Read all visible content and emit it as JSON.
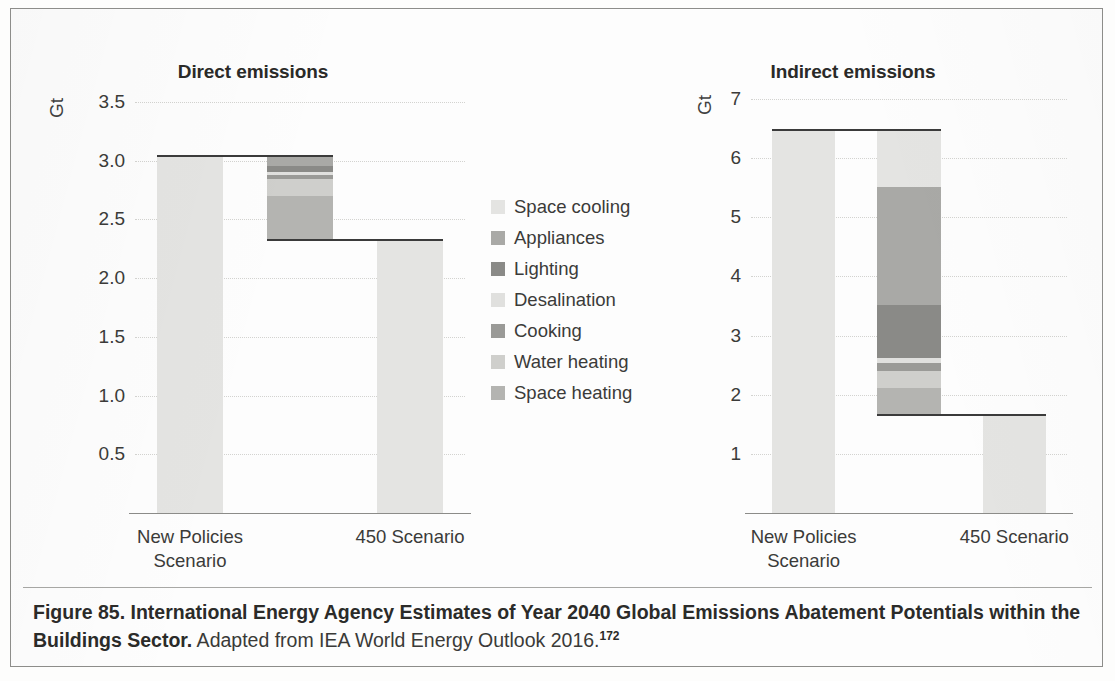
{
  "figure": {
    "caption_bold": "Figure 85. International Energy Agency Estimates of Year 2040 Global Emissions Abatement Potentials within the Buildings Sector.",
    "caption_source": " Adapted from IEA World Energy Outlook 2016.",
    "caption_footnote": "172"
  },
  "legend": {
    "position": "center-between-panels",
    "items": [
      {
        "label": "Space cooling",
        "color": "#e4e4e2"
      },
      {
        "label": "Appliances",
        "color": "#a9a9a6"
      },
      {
        "label": "Lighting",
        "color": "#8a8a87"
      },
      {
        "label": "Desalination",
        "color": "#e0e0de"
      },
      {
        "label": "Cooking",
        "color": "#9a9a97"
      },
      {
        "label": "Water heating",
        "color": "#cfcfcc"
      },
      {
        "label": "Space heating",
        "color": "#b4b4b1"
      }
    ]
  },
  "chart_data": [
    {
      "id": "direct",
      "type": "bar",
      "subtype": "stacked-waterfall",
      "title": "Direct emissions",
      "ylabel": "Gt",
      "xlabel": "",
      "categories": [
        "New Policies Scenario",
        "450 Scenario"
      ],
      "xtick_lines": [
        [
          "New Policies",
          "Scenario"
        ],
        [
          "450 Scenario"
        ]
      ],
      "ylim": [
        0,
        3.5
      ],
      "yticks": [
        "0.5",
        "1.0",
        "1.5",
        "2.0",
        "2.5",
        "3.0",
        "3.5"
      ],
      "ytick_values": [
        0.5,
        1.0,
        1.5,
        2.0,
        2.5,
        3.0,
        3.5
      ],
      "grid": true,
      "bars": [
        {
          "name": "New Policies Scenario",
          "kind": "total",
          "base": 0,
          "top": 3.05,
          "value": 3.05,
          "color": "#e4e4e2"
        },
        {
          "name": "Abatement wedges",
          "kind": "stack",
          "base": 2.33,
          "top": 3.05,
          "segments": [
            {
              "label": "Appliances",
              "from": 2.955,
              "to": 3.05,
              "value": 0.095,
              "color": "#a9a9a6"
            },
            {
              "label": "Lighting",
              "from": 2.9,
              "to": 2.955,
              "value": 0.055,
              "color": "#8a8a87"
            },
            {
              "label": "Desalination",
              "from": 2.875,
              "to": 2.9,
              "value": 0.025,
              "color": "#e0e0de"
            },
            {
              "label": "Cooking",
              "from": 2.84,
              "to": 2.875,
              "value": 0.035,
              "color": "#9a9a97"
            },
            {
              "label": "Water heating",
              "from": 2.7,
              "to": 2.84,
              "value": 0.14,
              "color": "#cfcfcc"
            },
            {
              "label": "Space heating",
              "from": 2.33,
              "to": 2.7,
              "value": 0.37,
              "color": "#b4b4b1"
            }
          ]
        },
        {
          "name": "450 Scenario",
          "kind": "total",
          "base": 0,
          "top": 2.33,
          "value": 2.33,
          "color": "#e4e4e2"
        }
      ],
      "connectors": [
        {
          "at": 3.05,
          "from_bar": 0,
          "to_bar": 1
        },
        {
          "at": 2.33,
          "from_bar": 1,
          "to_bar": 2
        }
      ]
    },
    {
      "id": "indirect",
      "type": "bar",
      "subtype": "stacked-waterfall",
      "title": "Indirect emissions",
      "ylabel": "Gt",
      "xlabel": "",
      "categories": [
        "New Policies Scenario",
        "450 Scenario"
      ],
      "xtick_lines": [
        [
          "New Policies",
          "Scenario"
        ],
        [
          "450 Scenario"
        ]
      ],
      "ylim": [
        0,
        7
      ],
      "yticks": [
        "1",
        "2",
        "3",
        "4",
        "5",
        "6",
        "7"
      ],
      "ytick_values": [
        1,
        2,
        3,
        4,
        5,
        6,
        7
      ],
      "grid": true,
      "bars": [
        {
          "name": "New Policies Scenario",
          "kind": "total",
          "base": 0,
          "top": 6.5,
          "value": 6.5,
          "color": "#e4e4e2"
        },
        {
          "name": "Abatement wedges",
          "kind": "stack",
          "base": 1.67,
          "top": 6.5,
          "segments": [
            {
              "label": "Space cooling",
              "from": 5.52,
              "to": 6.5,
              "value": 0.98,
              "color": "#e4e4e2"
            },
            {
              "label": "Appliances",
              "from": 3.52,
              "to": 5.52,
              "value": 2.0,
              "color": "#a9a9a6"
            },
            {
              "label": "Lighting",
              "from": 2.62,
              "to": 3.52,
              "value": 0.9,
              "color": "#8a8a87"
            },
            {
              "label": "Desalination",
              "from": 2.54,
              "to": 2.62,
              "value": 0.08,
              "color": "#e0e0de"
            },
            {
              "label": "Cooking",
              "from": 2.4,
              "to": 2.54,
              "value": 0.14,
              "color": "#9a9a97"
            },
            {
              "label": "Water heating",
              "from": 2.12,
              "to": 2.4,
              "value": 0.28,
              "color": "#cfcfcc"
            },
            {
              "label": "Space heating",
              "from": 1.67,
              "to": 2.12,
              "value": 0.45,
              "color": "#b4b4b1"
            }
          ]
        },
        {
          "name": "450 Scenario",
          "kind": "total",
          "base": 0,
          "top": 1.67,
          "value": 1.67,
          "color": "#e4e4e2"
        }
      ],
      "connectors": [
        {
          "at": 6.5,
          "from_bar": 0,
          "to_bar": 1
        },
        {
          "at": 1.67,
          "from_bar": 1,
          "to_bar": 2
        }
      ]
    }
  ]
}
